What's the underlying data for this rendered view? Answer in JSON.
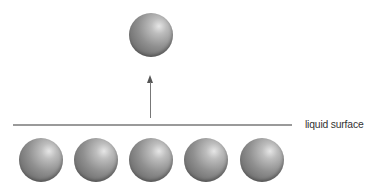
{
  "diagram": {
    "surface_label": "liquid surface",
    "escaping_particle": {
      "count": 1,
      "direction": "upward"
    },
    "liquid_particles": {
      "count": 5
    },
    "colors": {
      "sphere": "#8c8c8c",
      "line": "#9a9a9a",
      "text": "#333333"
    }
  }
}
